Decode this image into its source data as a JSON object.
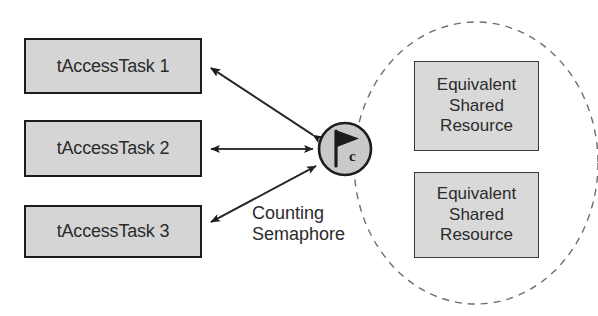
{
  "diagram": {
    "type": "counting-semaphore-shared-resource",
    "canvas": {
      "width": 598,
      "height": 316,
      "background": "#ffffff"
    },
    "colors": {
      "box_fill": "#d5d5d5",
      "box_border": "#1c1c1c",
      "resource_fill": "#d9d9d9",
      "resource_border": "#3a3a3a",
      "text": "#2b2b2b",
      "line": "#2a2a2a",
      "dashed_ellipse": "#6e6e6e",
      "semaphore_fill": "#c9c9c9"
    },
    "tasks": [
      {
        "id": "task-1",
        "label": "tAccessTask 1"
      },
      {
        "id": "task-2",
        "label": "tAccessTask 2"
      },
      {
        "id": "task-3",
        "label": "tAccessTask 3"
      }
    ],
    "semaphore": {
      "label_lines": [
        "Counting",
        "Semaphore"
      ],
      "icon": "flag-icon",
      "subscript": "c"
    },
    "resources": [
      {
        "id": "resource-1",
        "lines": [
          "Equivalent",
          "Shared",
          "Resource"
        ]
      },
      {
        "id": "resource-2",
        "lines": [
          "Equivalent",
          "Shared",
          "Resource"
        ]
      }
    ],
    "connections": [
      {
        "from": "task-1",
        "to": "semaphore",
        "style": "double-arrow"
      },
      {
        "from": "task-2",
        "to": "semaphore",
        "style": "double-arrow"
      },
      {
        "from": "task-3",
        "to": "semaphore",
        "style": "double-arrow"
      }
    ],
    "grouping": {
      "shape": "ellipse",
      "stroke": "dashed",
      "contains": [
        "semaphore",
        "resource-1",
        "resource-2"
      ]
    }
  }
}
